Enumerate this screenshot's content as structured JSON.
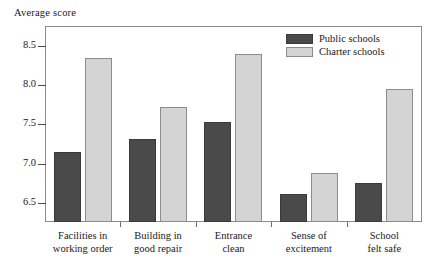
{
  "chart_data": {
    "type": "bar",
    "title": "",
    "subtitle": "",
    "xlabel": "",
    "ylabel": "Average score",
    "ylim": [
      6.26,
      8.75
    ],
    "grid": false,
    "legend_position": "top-right",
    "ytick_labels": [
      "8.5",
      "8.0",
      "7.5",
      "7.0",
      "6.5"
    ],
    "ytick_values": [
      8.5,
      8.0,
      7.5,
      7.0,
      6.5
    ],
    "categories": [
      "Facilities in working order",
      "Building in good repair",
      "Entrance clean",
      "Sense of excitement",
      "School felt safe"
    ],
    "category_lines": [
      [
        "Facilities in",
        "working order"
      ],
      [
        "Building in",
        "good repair"
      ],
      [
        "Entrance",
        "clean"
      ],
      [
        "Sense of",
        "excitement"
      ],
      [
        "School",
        "felt safe"
      ]
    ],
    "series": [
      {
        "name": "Public schools",
        "color": "#4a4a4a",
        "values": [
          7.15,
          7.32,
          7.53,
          6.62,
          6.76
        ]
      },
      {
        "name": "Charter schools",
        "color": "#d4d4d4",
        "values": [
          8.35,
          7.72,
          8.4,
          6.88,
          7.95
        ]
      }
    ]
  },
  "legend": {
    "items": [
      {
        "label": "Public schools"
      },
      {
        "label": "Charter schools"
      }
    ]
  }
}
